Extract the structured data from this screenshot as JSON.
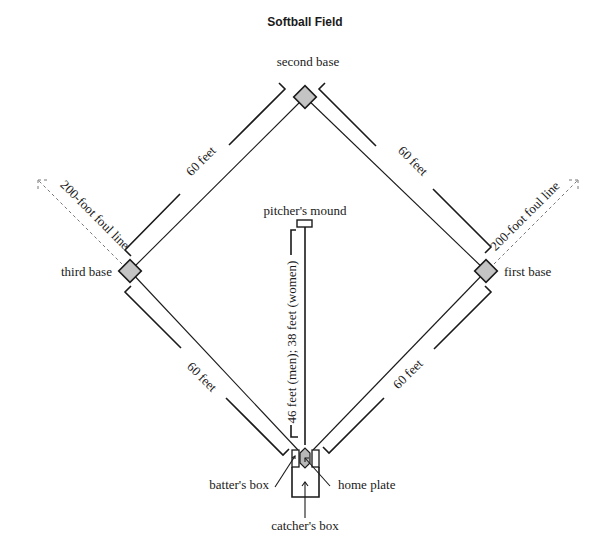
{
  "title": "Softball Field",
  "bases": {
    "second": "second base",
    "third": "third base",
    "first": "first base",
    "home": "home plate"
  },
  "labels": {
    "pitchers_mound": "pitcher's mound",
    "batters_box": "batter's box",
    "catchers_box": "catcher's box",
    "pitch_distance": "46 feet (men); 38 feet (women)",
    "base_distance_2_3": "60 feet",
    "base_distance_1_2": "60 feet",
    "base_distance_3_h": "60 feet",
    "base_distance_1_h": "60 feet",
    "foul_line_left": "200-foot foul line",
    "foul_line_right": "200-foot foul line"
  },
  "colors": {
    "base_fill": "#c4c4c4",
    "line": "#1a1a1a"
  }
}
